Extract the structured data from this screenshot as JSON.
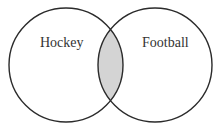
{
  "diagram": {
    "type": "venn",
    "sets": [
      {
        "label": "Hockey"
      },
      {
        "label": "Football"
      }
    ],
    "shaded_region": "intersection",
    "colors": {
      "stroke": "#2b2b2b",
      "shade": "#d4d4d4",
      "background": "#ffffff",
      "text": "#333333"
    }
  }
}
